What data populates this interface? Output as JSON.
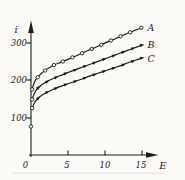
{
  "figure": {
    "background": "#fbfaf7",
    "ink": "#1b1b1b"
  },
  "chart_data": {
    "type": "line",
    "title": "",
    "xlabel": "E",
    "ylabel": "i",
    "x_ticks": [
      0,
      5,
      10,
      15
    ],
    "x_tick_labels": [
      "0",
      "5",
      "10",
      "15"
    ],
    "y_ticks": [
      100,
      200,
      300
    ],
    "y_tick_labels": [
      "100",
      "200",
      "300"
    ],
    "xlim": [
      0,
      17.2
    ],
    "ylim": [
      0,
      370
    ],
    "grid": false,
    "legend": "inline-labels-at-right",
    "series": [
      {
        "name": "A",
        "marker": "open-circle",
        "points": [
          [
            0.15,
            175
          ],
          [
            0.5,
            196
          ],
          [
            1,
            210
          ],
          [
            2,
            227
          ],
          [
            3,
            239
          ],
          [
            4,
            247
          ],
          [
            5,
            255
          ],
          [
            6.5,
            268
          ],
          [
            8,
            281
          ],
          [
            9.5,
            294
          ],
          [
            11,
            307
          ],
          [
            12.5,
            320
          ],
          [
            15,
            340
          ]
        ],
        "circle_marker_positions": [
          0.15,
          0.9,
          1.9,
          3.1,
          4.3,
          5.6,
          6.9,
          8.2,
          9.5,
          10.8,
          12.1,
          13.4,
          14.9
        ],
        "triangle_marker_positions": []
      },
      {
        "name": "B",
        "marker": "filled-triangle",
        "points": [
          [
            0.15,
            148
          ],
          [
            0.5,
            166
          ],
          [
            1,
            180
          ],
          [
            2,
            194
          ],
          [
            3,
            204
          ],
          [
            4,
            212
          ],
          [
            5,
            220
          ],
          [
            6.5,
            231
          ],
          [
            8,
            242
          ],
          [
            9.5,
            253
          ],
          [
            11,
            264
          ],
          [
            12.5,
            275
          ],
          [
            15,
            293
          ]
        ],
        "circle_marker_positions": [
          0.15
        ],
        "triangle_marker_positions": [
          1.0,
          2.2,
          3.4,
          4.7,
          6.0,
          7.3,
          8.6,
          9.9,
          11.2,
          12.5,
          13.8,
          15.0
        ]
      },
      {
        "name": "C",
        "marker": "filled-triangle",
        "points": [
          [
            0.15,
            125
          ],
          [
            0.5,
            140
          ],
          [
            1,
            152
          ],
          [
            2,
            166
          ],
          [
            3,
            175
          ],
          [
            4,
            183
          ],
          [
            5,
            190
          ],
          [
            6.5,
            200
          ],
          [
            8,
            211
          ],
          [
            9.5,
            221
          ],
          [
            11,
            231
          ],
          [
            12.5,
            241
          ],
          [
            15,
            259
          ]
        ],
        "circle_marker_positions": [
          0.15
        ],
        "triangle_marker_positions": [
          1.0,
          2.2,
          3.4,
          4.7,
          6.0,
          7.3,
          8.6,
          9.9,
          11.2,
          12.5,
          13.8,
          15.0
        ]
      }
    ],
    "isolated_points": [
      {
        "x": 0,
        "y": 76,
        "marker": "open-circle"
      }
    ]
  }
}
